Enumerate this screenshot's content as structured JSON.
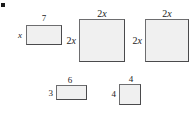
{
  "figure": {
    "background_color": "#ffffff",
    "shape_fill": "#f0f0f0",
    "shape_stroke": "#59595b",
    "text_color": "#1c1c1c",
    "corner_marker": {
      "name": "corner-marker",
      "x": 1,
      "y": 3,
      "width": 4,
      "height": 4,
      "color": "#1a1a1a"
    },
    "shapes": [
      {
        "id": "rect-1",
        "kind": "rectangle",
        "x": 26,
        "y": 25,
        "width": 36,
        "height": 20,
        "top_label": "7",
        "top_label_kind": "number",
        "left_label": "x",
        "left_label_kind": "variable",
        "top_label_x": 44,
        "top_label_y": 14,
        "left_label_x": 22,
        "left_label_y": 35,
        "font_size": 9
      },
      {
        "id": "rect-2",
        "kind": "square",
        "x": 79,
        "y": 19,
        "width": 46,
        "height": 43,
        "top_label": "2x",
        "top_label_kind": "mixed",
        "top_label_coef": "2",
        "top_label_var": "x",
        "left_label": "2x",
        "left_label_kind": "mixed",
        "left_label_coef": "2",
        "left_label_var": "x",
        "top_label_x": 102,
        "top_label_y": 9,
        "left_label_x": 76,
        "left_label_y": 41,
        "font_size": 10
      },
      {
        "id": "rect-3",
        "kind": "square",
        "x": 145,
        "y": 19,
        "width": 44,
        "height": 43,
        "top_label": "2x",
        "top_label_kind": "mixed",
        "top_label_coef": "2",
        "top_label_var": "x",
        "left_label": "2x",
        "left_label_kind": "mixed",
        "left_label_coef": "2",
        "left_label_var": "x",
        "top_label_x": 167,
        "top_label_y": 9,
        "left_label_x": 142,
        "left_label_y": 41,
        "font_size": 10
      },
      {
        "id": "rect-4",
        "kind": "rectangle",
        "x": 56,
        "y": 85,
        "width": 31,
        "height": 15,
        "top_label": "6",
        "top_label_kind": "number",
        "left_label": "3",
        "left_label_kind": "number",
        "top_label_x": 70,
        "top_label_y": 76,
        "left_label_x": 53,
        "left_label_y": 93,
        "font_size": 9
      },
      {
        "id": "rect-5",
        "kind": "square",
        "x": 119,
        "y": 84,
        "width": 22,
        "height": 21,
        "top_label": "4",
        "top_label_kind": "number",
        "left_label": "4",
        "left_label_kind": "number",
        "top_label_x": 131,
        "top_label_y": 75,
        "left_label_x": 116,
        "left_label_y": 94,
        "font_size": 9
      }
    ]
  }
}
